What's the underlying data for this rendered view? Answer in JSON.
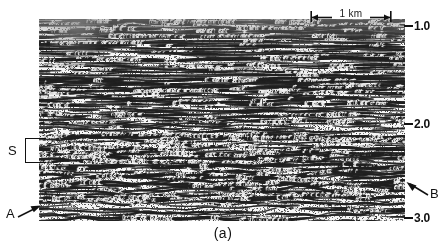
{
  "figure": {
    "caption": "(a)",
    "type": "seismic-reflection-section"
  },
  "scale_bar": {
    "label": "1 km",
    "left_cap_icon": "scale-left-arrow-icon",
    "right_cap_icon": "scale-right-arrow-icon"
  },
  "time_axis": {
    "unit": "s",
    "ticks": [
      {
        "label": "1.0",
        "value": 1.0
      },
      {
        "label": "2.0",
        "value": 2.0
      },
      {
        "label": "3.0",
        "value": 3.0
      }
    ]
  },
  "annotations": {
    "s": {
      "label": "S",
      "bracket_icon": "bracket-icon"
    },
    "a": {
      "label": "A",
      "arrow_icon": "arrow-up-right-icon"
    },
    "b": {
      "label": "B",
      "arrow_icon": "arrow-up-left-icon"
    }
  },
  "colors": {
    "trace": "#111111",
    "background": "#ffffff",
    "haze": "#9a9a9a"
  },
  "chart_data": {
    "type": "heatmap",
    "title": "",
    "subtitle": "",
    "xlabel": "",
    "ylabel": "Two-way traveltime (s)",
    "render_style": "variable-area wiggle trace",
    "grid": false,
    "legend": null,
    "xlim": [
      0,
      4.6
    ],
    "ylim": [
      3.0,
      0.9
    ],
    "x_unit": "km",
    "y_unit": "s",
    "x_scale_bar_km": 1.0,
    "y_tick_values": [
      1.0,
      2.0,
      3.0
    ],
    "y_tick_labels": [
      "1.0",
      "2.0",
      "3.0"
    ],
    "panel_time_top": 0.9,
    "panel_time_bottom": 3.04,
    "trace_count": 300,
    "annotations": [
      {
        "label": "S",
        "kind": "bracket",
        "time_range": [
          2.2,
          2.45
        ],
        "side": "left"
      },
      {
        "label": "A",
        "kind": "arrow",
        "time": 2.93,
        "x_km": 0.1,
        "side": "left"
      },
      {
        "label": "B",
        "kind": "arrow",
        "time": 2.72,
        "x_km": 4.5,
        "side": "right"
      }
    ],
    "reflector_packages": [
      {
        "name": "upper layered sequence",
        "time_range": [
          0.9,
          1.9
        ],
        "character": "strong continuous parallel reflectors"
      },
      {
        "name": "S zone",
        "time_range": [
          2.2,
          2.45
        ],
        "character": "bright laterally continuous band"
      },
      {
        "name": "lower chaotic zone",
        "time_range": [
          2.45,
          3.0
        ],
        "character": "discontinuous wavy diffracted events"
      }
    ]
  }
}
